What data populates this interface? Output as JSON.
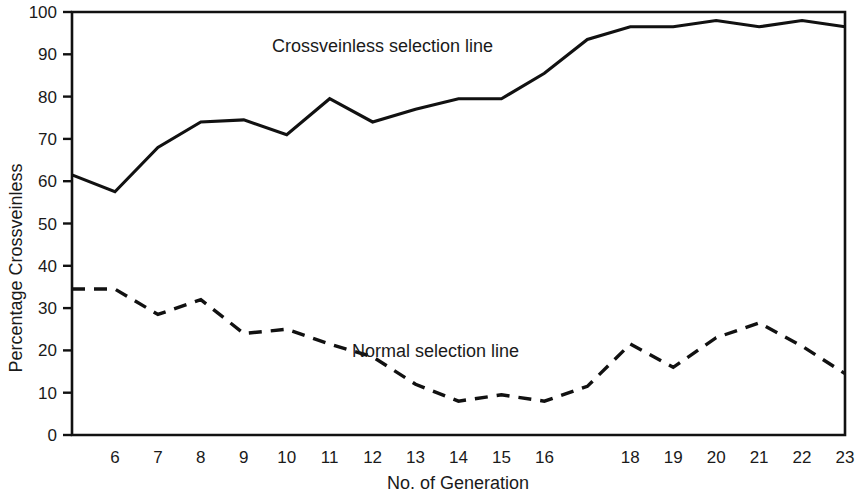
{
  "chart_data": {
    "type": "line",
    "title": "",
    "xlabel": "No. of Generation",
    "ylabel": "Percentage Crossveinless",
    "xlim": [
      5,
      23
    ],
    "ylim": [
      0,
      100
    ],
    "grid": false,
    "legend_position": "inline-annotation",
    "x": [
      5,
      6,
      7,
      8,
      9,
      10,
      11,
      12,
      13,
      14,
      15,
      16,
      17,
      18,
      19,
      20,
      21,
      22,
      23
    ],
    "x_tick_labels": [
      "",
      "6",
      "7",
      "8",
      "9",
      "10",
      "11",
      "12",
      "13",
      "14",
      "15",
      "16",
      "",
      "18",
      "19",
      "20",
      "21",
      "22",
      "23"
    ],
    "y_tick_labels": [
      "0",
      "10",
      "20",
      "30",
      "40",
      "50",
      "60",
      "70",
      "80",
      "90",
      "100"
    ],
    "y_ticks": [
      0,
      10,
      20,
      30,
      40,
      50,
      60,
      70,
      80,
      90,
      100
    ],
    "series": [
      {
        "name": "Crossveinless selection line",
        "style": "solid",
        "color": "#111111",
        "values": [
          61.5,
          57.5,
          68.0,
          74.0,
          74.5,
          71.0,
          79.5,
          74.0,
          77.0,
          79.5,
          79.5,
          85.5,
          93.5,
          96.5,
          96.5,
          98.0,
          96.5,
          98.0,
          96.5
        ]
      },
      {
        "name": "Normal selection line",
        "style": "dashed",
        "color": "#111111",
        "values": [
          34.5,
          34.5,
          28.5,
          32.0,
          24.0,
          25.0,
          21.5,
          18.5,
          12.0,
          8.0,
          9.5,
          8.0,
          11.5,
          21.5,
          16.0,
          23.0,
          26.5,
          21.0,
          14.5
        ]
      }
    ],
    "annotations": [
      {
        "text": "Crossveinless selection line",
        "x_px": 272,
        "y_px": 52
      },
      {
        "text": "Normal selection line",
        "x_px": 352,
        "y_px": 357
      }
    ]
  },
  "axes": {
    "x_title": "No. of Generation",
    "y_title": "Percentage Crossveinless"
  }
}
